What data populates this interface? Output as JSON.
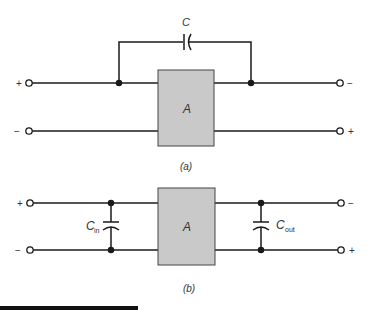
{
  "figure": {
    "panel_a": {
      "caption": "(a)",
      "block_label": "A",
      "capacitor_label": "C",
      "left_terminals": {
        "top": "+",
        "bottom": "−"
      },
      "right_terminals": {
        "top": "−",
        "bottom": "+"
      }
    },
    "panel_b": {
      "caption": "(b)",
      "block_label": "A",
      "input_capacitor": {
        "main": "C",
        "sub": "in"
      },
      "output_capacitor": {
        "main": "C",
        "sub": "out"
      },
      "left_terminals": {
        "top": "+",
        "bottom": "−"
      },
      "right_terminals": {
        "top": "−",
        "bottom": "+"
      }
    },
    "colors": {
      "wire": "#1a1a1a",
      "block_fill": "#c9c9c9",
      "block_stroke": "#444444"
    }
  }
}
